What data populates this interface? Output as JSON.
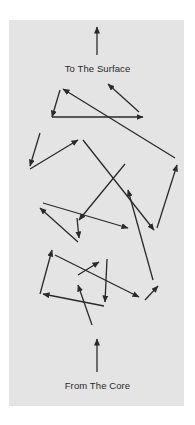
{
  "diagram": {
    "title_top": "To The Surface",
    "title_bottom": "From The Core",
    "colors": {
      "background": "#ffffff",
      "panel": "#e4e4e4",
      "arrow": "#2a2a2a",
      "text": "#2a2a2a"
    },
    "arrows": [
      {
        "from": [
          97,
          55
        ],
        "to": [
          97,
          27
        ],
        "head": true
      },
      {
        "from": [
          60,
          90
        ],
        "to": [
          52,
          117
        ],
        "head": true
      },
      {
        "from": [
          52,
          117
        ],
        "to": [
          143,
          117
        ],
        "head": true
      },
      {
        "from": [
          139,
          112
        ],
        "to": [
          108,
          84
        ],
        "head": true
      },
      {
        "from": [
          175,
          158
        ],
        "to": [
          63,
          89
        ],
        "head": true
      },
      {
        "from": [
          40,
          133
        ],
        "to": [
          30,
          166
        ],
        "head": true
      },
      {
        "from": [
          30,
          169
        ],
        "to": [
          78,
          140
        ],
        "head": true
      },
      {
        "from": [
          83,
          140
        ],
        "to": [
          154,
          230
        ],
        "head": true
      },
      {
        "from": [
          157,
          228
        ],
        "to": [
          177,
          165
        ],
        "head": true
      },
      {
        "from": [
          125,
          164
        ],
        "to": [
          79,
          220
        ],
        "head": true
      },
      {
        "from": [
          153,
          280
        ],
        "to": [
          128,
          190
        ],
        "head": true
      },
      {
        "from": [
          43,
          203
        ],
        "to": [
          128,
          228
        ],
        "head": true
      },
      {
        "from": [
          78,
          242
        ],
        "to": [
          40,
          208
        ],
        "head": true
      },
      {
        "from": [
          77,
          218
        ],
        "to": [
          79,
          238
        ],
        "head": true
      },
      {
        "from": [
          55,
          255
        ],
        "to": [
          139,
          297
        ],
        "head": true
      },
      {
        "from": [
          40,
          294
        ],
        "to": [
          52,
          250
        ],
        "head": true
      },
      {
        "from": [
          78,
          275
        ],
        "to": [
          99,
          262
        ],
        "head": true
      },
      {
        "from": [
          107,
          259
        ],
        "to": [
          105,
          302
        ],
        "head": true
      },
      {
        "from": [
          104,
          306
        ],
        "to": [
          43,
          294
        ],
        "head": true
      },
      {
        "from": [
          92,
          325
        ],
        "to": [
          78,
          285
        ],
        "head": true
      },
      {
        "from": [
          145,
          300
        ],
        "to": [
          158,
          286
        ],
        "head": true
      },
      {
        "from": [
          97,
          372
        ],
        "to": [
          97,
          339
        ],
        "head": true
      }
    ]
  }
}
